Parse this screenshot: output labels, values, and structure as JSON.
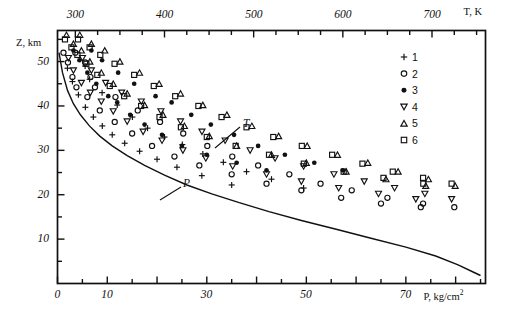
{
  "figure": {
    "kind": "scatter-with-fitted-curves",
    "top_axis": {
      "label": "T, K",
      "ticks_major": [
        300,
        400,
        500,
        600,
        700
      ],
      "range": [
        280,
        760
      ],
      "minor_step": 25
    },
    "bottom_axis": {
      "label": "P, kg/cm",
      "label_sup": "2",
      "ticks_major": [
        0,
        10,
        30,
        50,
        70
      ],
      "ticks_minor": [
        20,
        40,
        60,
        80
      ],
      "range": [
        0,
        86
      ]
    },
    "left_axis": {
      "label": "Z, km",
      "ticks_major": [
        10,
        20,
        30,
        40,
        50
      ],
      "range": [
        0,
        57
      ]
    },
    "annotations": [
      {
        "name": "T-curve-label",
        "text": "T",
        "x": 243,
        "y": 118,
        "leader": [
          [
            240,
            127
          ],
          [
            215,
            148
          ]
        ]
      },
      {
        "name": "P-curve-label",
        "text": "P",
        "x": 183,
        "y": 178,
        "leader": [
          [
            181,
            187
          ],
          [
            160,
            200
          ]
        ]
      }
    ]
  },
  "legend": {
    "items": [
      {
        "n": "1",
        "marker": "plus-marker"
      },
      {
        "n": "2",
        "marker": "open-circle-marker"
      },
      {
        "n": "3",
        "marker": "filled-circle-marker"
      },
      {
        "n": "4",
        "marker": "down-triangle-marker"
      },
      {
        "n": "5",
        "marker": "up-triangle-marker"
      },
      {
        "n": "6",
        "marker": "open-square-marker"
      }
    ]
  },
  "chart_data": {
    "type": "scatter",
    "title": "",
    "xlabel": "P, kg/cm2",
    "ylabel": "Z, km",
    "x2label": "T, K",
    "xlim": [
      0,
      86
    ],
    "ylim": [
      0,
      57
    ],
    "x2lim": [
      280,
      760
    ],
    "grid": false,
    "legend_position": "top-right-inside",
    "series": [
      {
        "name": "1",
        "marker": "plus",
        "points_T": [
          [
            311,
            49.0
          ],
          [
            316,
            46.0
          ],
          [
            330,
            43.0
          ],
          [
            347,
            40.2
          ],
          [
            364,
            37.5
          ],
          [
            381,
            35.0
          ],
          [
            400,
            33.0
          ],
          [
            420,
            31.3
          ],
          [
            443,
            29.2
          ],
          [
            466,
            27.3
          ],
          [
            492,
            25.2
          ],
          [
            520,
            23.5
          ],
          [
            556,
            21.5
          ]
        ],
        "points_P": [
          [
            2.0,
            48.5
          ],
          [
            3.0,
            45.5
          ],
          [
            4.2,
            42.5
          ],
          [
            5.6,
            39.7
          ],
          [
            7.2,
            37.5
          ],
          [
            9.0,
            35.5
          ],
          [
            11.0,
            33.5
          ],
          [
            13.5,
            31.6
          ],
          [
            16.5,
            29.8
          ],
          [
            20.0,
            28.0
          ],
          [
            24.0,
            26.2
          ],
          [
            29.0,
            24.3
          ],
          [
            35.0,
            22.2
          ]
        ]
      },
      {
        "name": "2",
        "marker": "open-circle",
        "points_T": [
          [
            300,
            52.0
          ],
          [
            311,
            49.8
          ],
          [
            317,
            46.5
          ],
          [
            322,
            44.2
          ],
          [
            345,
            42.0
          ],
          [
            370,
            39.0
          ],
          [
            395,
            36.4
          ],
          [
            421,
            33.8
          ],
          [
            448,
            31.0
          ],
          [
            476,
            28.6
          ],
          [
            505,
            26.6
          ],
          [
            540,
            24.6
          ],
          [
            575,
            22.5
          ],
          [
            610,
            21.0
          ],
          [
            650,
            19.3
          ],
          [
            690,
            18.0
          ],
          [
            725,
            17.2
          ]
        ],
        "points_P": [
          [
            1.2,
            52.0
          ],
          [
            2.1,
            49.8
          ],
          [
            3.0,
            46.5
          ],
          [
            3.8,
            44.2
          ],
          [
            6.0,
            42.0
          ],
          [
            8.5,
            39.0
          ],
          [
            11.5,
            36.4
          ],
          [
            15.0,
            33.8
          ],
          [
            19.0,
            31.0
          ],
          [
            23.5,
            28.6
          ],
          [
            28.5,
            26.6
          ],
          [
            35.0,
            24.6
          ],
          [
            42.0,
            22.5
          ],
          [
            49.0,
            21.0
          ],
          [
            57.0,
            19.3
          ],
          [
            65.0,
            18.0
          ],
          [
            73.0,
            17.2
          ]
        ]
      },
      {
        "name": "3",
        "marker": "filled-circle",
        "points_T": [
          [
            318,
            52.5
          ],
          [
            330,
            50.3
          ],
          [
            348,
            47.5
          ],
          [
            366,
            45.0
          ],
          [
            390,
            42.2
          ],
          [
            408,
            40.8
          ],
          [
            430,
            38.0
          ],
          [
            452,
            35.8
          ],
          [
            478,
            33.5
          ],
          [
            505,
            31.0
          ],
          [
            535,
            29.0
          ],
          [
            568,
            27.2
          ],
          [
            600,
            25.5
          ]
        ],
        "points_P": [
          [
            3.2,
            52.5
          ],
          [
            4.4,
            50.3
          ],
          [
            6.0,
            47.5
          ],
          [
            7.8,
            45.0
          ],
          [
            10.2,
            42.2
          ],
          [
            12.0,
            40.8
          ],
          [
            14.6,
            38.0
          ],
          [
            17.5,
            35.8
          ],
          [
            21.0,
            33.5
          ],
          [
            25.0,
            31.0
          ],
          [
            30.0,
            29.0
          ],
          [
            36.0,
            27.2
          ],
          [
            42.0,
            25.5
          ]
        ]
      },
      {
        "name": "4",
        "marker": "down-triangle",
        "points_T": [
          [
            308,
            50.8
          ],
          [
            318,
            48.0
          ],
          [
            334,
            45.2
          ],
          [
            352,
            43.0
          ],
          [
            374,
            41.0
          ],
          [
            396,
            38.8
          ],
          [
            418,
            36.5
          ],
          [
            442,
            34.2
          ],
          [
            468,
            32.2
          ],
          [
            496,
            30.0
          ],
          [
            524,
            28.2
          ],
          [
            556,
            26.4
          ],
          [
            590,
            24.6
          ],
          [
            624,
            23.0
          ],
          [
            658,
            21.5
          ],
          [
            692,
            20.2
          ],
          [
            722,
            19.0
          ]
        ],
        "points_P": [
          [
            2.2,
            50.8
          ],
          [
            3.2,
            48.0
          ],
          [
            4.8,
            45.2
          ],
          [
            6.6,
            43.0
          ],
          [
            8.8,
            41.0
          ],
          [
            11.2,
            38.8
          ],
          [
            14.0,
            36.5
          ],
          [
            17.2,
            34.2
          ],
          [
            21.0,
            32.2
          ],
          [
            25.2,
            30.0
          ],
          [
            29.8,
            28.2
          ],
          [
            35.2,
            26.4
          ],
          [
            42.0,
            24.6
          ],
          [
            49.0,
            23.0
          ],
          [
            56.5,
            21.5
          ],
          [
            64.5,
            20.2
          ],
          [
            72.0,
            19.0
          ]
        ]
      },
      {
        "name": "5",
        "marker": "up-triangle",
        "points_T": [
          [
            305,
            56.0
          ],
          [
            318,
            54.0
          ],
          [
            333,
            52.5
          ],
          [
            350,
            50.0
          ],
          [
            372,
            47.5
          ],
          [
            394,
            45.0
          ],
          [
            418,
            42.8
          ],
          [
            443,
            40.2
          ],
          [
            470,
            38.0
          ],
          [
            498,
            35.5
          ],
          [
            528,
            33.2
          ],
          [
            560,
            31.0
          ],
          [
            594,
            29.0
          ],
          [
            628,
            27.2
          ],
          [
            662,
            25.2
          ],
          [
            696,
            23.5
          ],
          [
            726,
            22.0
          ]
        ],
        "points_P": [
          [
            1.8,
            56.0
          ],
          [
            3.2,
            54.0
          ],
          [
            4.8,
            52.5
          ],
          [
            6.5,
            50.0
          ],
          [
            8.8,
            47.5
          ],
          [
            11.2,
            45.0
          ],
          [
            14.0,
            42.8
          ],
          [
            17.5,
            40.2
          ],
          [
            21.2,
            38.0
          ],
          [
            25.5,
            35.5
          ],
          [
            30.5,
            33.2
          ],
          [
            36.0,
            31.0
          ],
          [
            43.0,
            29.0
          ],
          [
            50.0,
            27.2
          ],
          [
            58.0,
            25.2
          ],
          [
            66.0,
            23.5
          ],
          [
            74.0,
            22.0
          ]
        ]
      },
      {
        "name": "6",
        "marker": "open-square",
        "points_T": [
          [
            303,
            55.0
          ],
          [
            316,
            53.2
          ],
          [
            328,
            51.5
          ],
          [
            344,
            49.5
          ],
          [
            366,
            47.0
          ],
          [
            388,
            44.5
          ],
          [
            412,
            42.2
          ],
          [
            438,
            40.0
          ],
          [
            464,
            37.5
          ],
          [
            492,
            35.2
          ],
          [
            522,
            33.0
          ],
          [
            554,
            31.0
          ],
          [
            588,
            29.0
          ],
          [
            622,
            27.0
          ],
          [
            656,
            25.2
          ],
          [
            690,
            23.8
          ],
          [
            722,
            22.5
          ]
        ],
        "points_P": [
          [
            1.5,
            55.0
          ],
          [
            2.8,
            53.2
          ],
          [
            4.0,
            51.5
          ],
          [
            5.8,
            49.5
          ],
          [
            8.0,
            47.0
          ],
          [
            10.5,
            44.5
          ],
          [
            13.4,
            42.2
          ],
          [
            16.8,
            40.0
          ],
          [
            20.5,
            37.5
          ],
          [
            24.8,
            35.2
          ],
          [
            30.0,
            33.0
          ],
          [
            35.8,
            31.0
          ],
          [
            42.5,
            29.0
          ],
          [
            49.5,
            27.0
          ],
          [
            57.5,
            25.2
          ],
          [
            65.5,
            23.8
          ],
          [
            73.5,
            22.5
          ]
        ]
      }
    ],
    "fitted_curves": [
      {
        "name": "P",
        "label": "P",
        "points": [
          [
            0.3,
            52.0
          ],
          [
            1.0,
            47.5
          ],
          [
            2.0,
            43.5
          ],
          [
            3.2,
            40.5
          ],
          [
            4.6,
            38.0
          ],
          [
            6.4,
            35.5
          ],
          [
            8.5,
            33.2
          ],
          [
            11.0,
            31.0
          ],
          [
            14.0,
            28.8
          ],
          [
            17.5,
            26.6
          ],
          [
            21.5,
            24.4
          ],
          [
            26.0,
            22.2
          ],
          [
            31.0,
            20.2
          ],
          [
            36.5,
            18.2
          ],
          [
            42.5,
            16.2
          ],
          [
            49.0,
            14.2
          ],
          [
            56.0,
            12.2
          ],
          [
            63.0,
            10.2
          ],
          [
            70.0,
            8.2
          ],
          [
            76.0,
            6.2
          ],
          [
            80.5,
            4.2
          ],
          [
            83.5,
            2.6
          ],
          [
            85.0,
            1.8
          ]
        ]
      },
      {
        "name": "T",
        "label": "T",
        "points": []
      }
    ]
  }
}
